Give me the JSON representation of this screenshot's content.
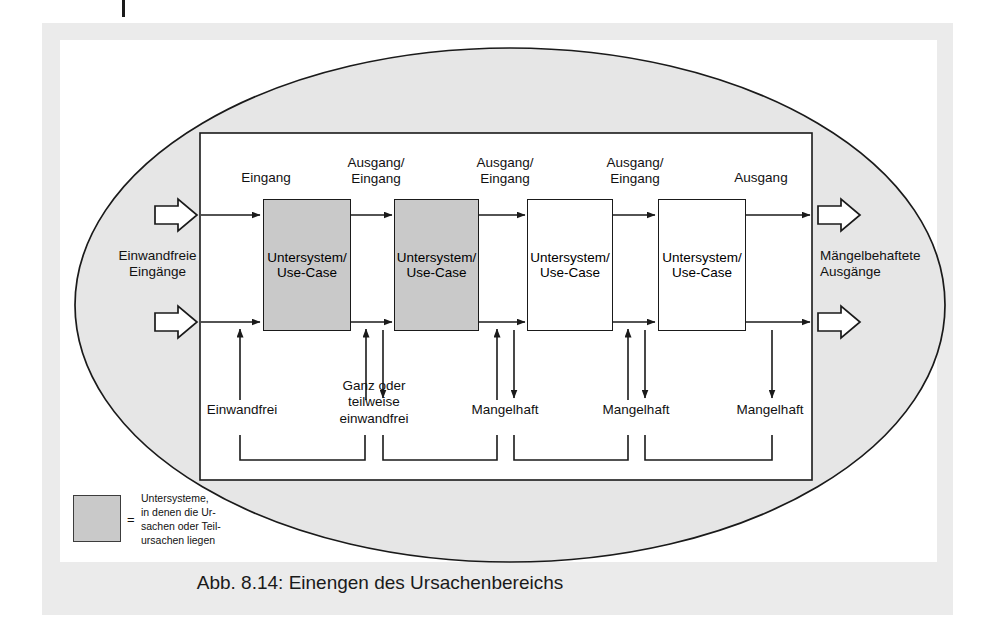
{
  "figure": {
    "caption": "Abb. 8.14: Einengen des Ursachenbereichs",
    "outer_shape": "ellipse",
    "inner_shape": "rectangle",
    "colors": {
      "page_background": "#ffffff",
      "panel_background": "#ebebeb",
      "ellipse_fill": "#e6e6e6",
      "shaded_box_fill": "#c9c9c9",
      "plain_box_fill": "#ffffff",
      "stroke": "#1a1a1a",
      "text": "#111111"
    }
  },
  "left_side": {
    "label": "Einwandfreie\nEingänge",
    "arrows": 2
  },
  "right_side": {
    "label": "Mängelbehaftete\nAusgänge",
    "arrows": 2
  },
  "top_labels": [
    {
      "text": "Eingang"
    },
    {
      "text": "Ausgang/\nEingang"
    },
    {
      "text": "Ausgang/\nEingang"
    },
    {
      "text": "Ausgang/\nEingang"
    },
    {
      "text": "Ausgang"
    }
  ],
  "boxes": [
    {
      "line1": "Untersystem/",
      "line2": "Use-Case",
      "shaded": true
    },
    {
      "line1": "Untersystem/",
      "line2": "Use-Case",
      "shaded": true
    },
    {
      "line1": "Untersystem/",
      "line2": "Use-Case",
      "shaded": false
    },
    {
      "line1": "Untersystem/",
      "line2": "Use-Case",
      "shaded": false
    }
  ],
  "bottom_labels": [
    {
      "text": "Einwandfrei"
    },
    {
      "text": "Ganz oder\nteilweise\neinwandfrei"
    },
    {
      "text": "Mangelhaft"
    },
    {
      "text": "Mangelhaft"
    },
    {
      "text": "Mangelhaft"
    }
  ],
  "legend": {
    "equals_sign": "=",
    "swatch_color": "#c9c9c9",
    "text": "Untersysteme,\nin denen die Ur-\nsachen oder Teil-\nursachen liegen"
  }
}
